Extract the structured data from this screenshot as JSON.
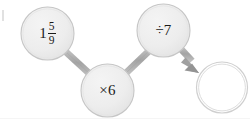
{
  "diagram": {
    "type": "function-machine-chain",
    "background_color": "#ffffff",
    "node_fill_color": "#ececec",
    "node_stroke_color": "#c2c2c2",
    "connector_color": "#a9a9a9",
    "text_color": "#1a1a1a",
    "nodes": [
      {
        "id": "node-start-value",
        "name": "start-value-node",
        "label": "1 5/9",
        "label_kind": "mixed-number",
        "whole": "1",
        "numerator": "5",
        "denominator": "9",
        "filled": true,
        "cx": 47.5,
        "cy": 33.5,
        "r": 26.5
      },
      {
        "id": "node-operation-multiply",
        "name": "multiply-operation-node",
        "label": "×6",
        "label_kind": "operation",
        "operator": "×",
        "operand": "6",
        "filled": true,
        "cx": 107.5,
        "cy": 90.5,
        "r": 26.5
      },
      {
        "id": "node-operation-divide",
        "name": "divide-operation-node",
        "label": "÷7",
        "label_kind": "operation",
        "operator": "÷",
        "operand": "7",
        "filled": true,
        "cx": 163.5,
        "cy": 30.5,
        "r": 26.5
      },
      {
        "id": "node-result-blank",
        "name": "result-answer-node",
        "label": "",
        "label_kind": "blank",
        "filled": false,
        "cx": 222,
        "cy": 87.5,
        "r": 25.5
      }
    ],
    "connectors": [
      {
        "id": "connector-1",
        "name": "connector-start-to-multiply",
        "from": "node-start-value",
        "to": "node-operation-multiply",
        "arrowhead": false
      },
      {
        "id": "connector-2",
        "name": "connector-multiply-to-divide",
        "from": "node-operation-multiply",
        "to": "node-operation-divide",
        "arrowhead": false
      },
      {
        "id": "connector-3",
        "name": "connector-divide-to-result",
        "from": "node-operation-divide",
        "to": "node-result-blank",
        "arrowhead": true
      }
    ]
  }
}
